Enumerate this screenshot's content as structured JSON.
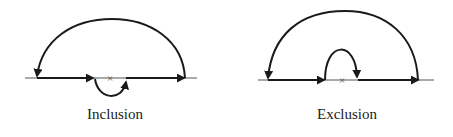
{
  "diagrams": [
    {
      "label": "Inclusion",
      "marker": "×"
    },
    {
      "label": "Exclusion",
      "marker": "×"
    }
  ],
  "colors": {
    "stroke": "#1a1a1a",
    "background": "#ffffff"
  }
}
